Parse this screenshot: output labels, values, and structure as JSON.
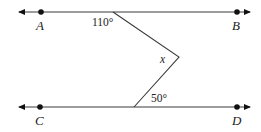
{
  "diagram": {
    "type": "parallel-lines-angle",
    "points": {
      "A": "A",
      "B": "B",
      "C": "C",
      "D": "D"
    },
    "angles": {
      "top": "110°",
      "middle": "x",
      "bottom": "50°"
    },
    "colors": {
      "line": "#3a3a3a",
      "point": "#111111",
      "text": "#222222"
    }
  }
}
